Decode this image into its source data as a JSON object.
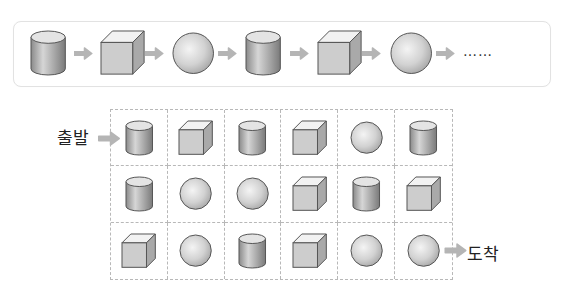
{
  "pattern": {
    "sequence": [
      "cylinder",
      "cube",
      "sphere",
      "cylinder",
      "cube",
      "sphere"
    ],
    "continuation": "……",
    "arrow_color": "#b5b5b5"
  },
  "maze": {
    "start_label": "출발",
    "end_label": "도착",
    "rows": [
      [
        "cylinder",
        "cube",
        "cylinder",
        "cube",
        "sphere",
        "cylinder"
      ],
      [
        "cylinder",
        "sphere",
        "sphere",
        "cube",
        "cylinder",
        "cube"
      ],
      [
        "cube",
        "sphere",
        "cylinder",
        "cube",
        "sphere",
        "sphere"
      ]
    ],
    "border_color": "#b8b8b8"
  },
  "colors": {
    "shape_fill": "#c8c8c8",
    "shape_stroke": "#555555",
    "arrow": "#b5b5b5"
  }
}
